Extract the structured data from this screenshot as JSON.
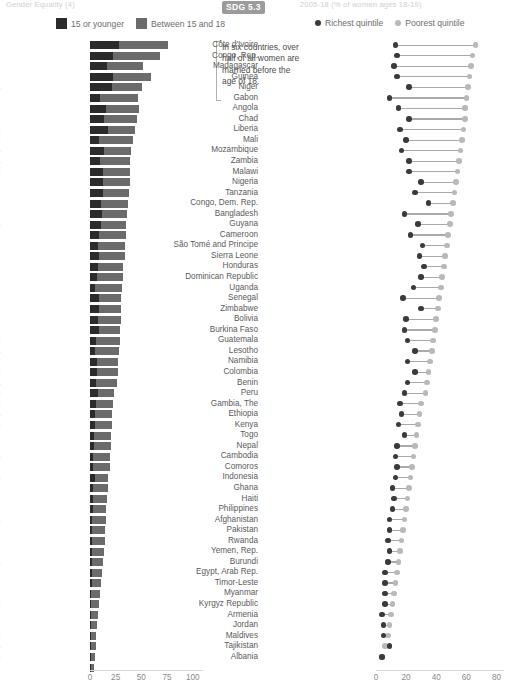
{
  "header": {
    "left_text": "Gender Equality (4)",
    "right_text": "2005-18 (% of women ages 18-19)",
    "sdg_badge": "SDG 5.3"
  },
  "legend_left": {
    "items": [
      {
        "label": "15 or younger",
        "color": "#2b2b2b",
        "icon": "square-swatch"
      },
      {
        "label": "Between 15 and 18",
        "color": "#6b6b6b",
        "icon": "square-swatch"
      }
    ]
  },
  "legend_right": {
    "items": [
      {
        "label": "Richest quintile",
        "color": "#3a3a3a",
        "icon": "dot-marker"
      },
      {
        "label": "Poorest quintile",
        "color": "#b9b9b9",
        "icon": "dot-marker"
      }
    ]
  },
  "annotation": {
    "text": "In six countries, over half of all women are married before the age of 18."
  },
  "chart_data": [
    {
      "id": "left",
      "type": "bar",
      "orientation": "horizontal",
      "stacked": true,
      "title": "",
      "xlabel": "",
      "ylabel": "",
      "xlim": [
        0,
        110
      ],
      "xticks": [
        0,
        25,
        50,
        75,
        100
      ],
      "grid": false,
      "legend_position": "top-left",
      "series": [
        {
          "name": "15 or younger",
          "color": "#2b2b2b"
        },
        {
          "name": "Between 15 and 18",
          "color": "#6b6b6b"
        }
      ],
      "categories": [
        "Niger",
        "Chad",
        "Mali",
        "Bangladesh",
        "Guinea",
        "Burkina Faso",
        "Mozambique",
        "Madagascar",
        "Nigeria",
        "Malawi",
        "Ethiopia",
        "Uganda",
        "Nepal",
        "Sierra Leone",
        "Cameroon",
        "Congo, Dem. Rep.",
        "Dominican Republic",
        "Liberia",
        "Afghanistan",
        "São Tomé and Principe",
        "Honduras",
        "Côte d'Ivoire",
        "Congo, Rep.",
        "Zimbabwe",
        "Yemen, Rep.",
        "Benin",
        "Comoros",
        "Senegal",
        "Zambia",
        "Tanzania",
        "Gambia, The",
        "Angola",
        "Guatemala",
        "India",
        "Colombia",
        "Guyana",
        "Kenya",
        "Gabon",
        "Togo",
        "Bolivia",
        "Pakistan",
        "Ghana",
        "Burundi",
        "Peru",
        "Timor-Leste",
        "Cambodia",
        "Haiti",
        "Egypt, Arab Rep.",
        "Lesotho",
        "Indonesia",
        "Myanmar",
        "Philippines",
        "Tajikistan",
        "Albania",
        "Jordan",
        "Kyrgyz Republic",
        "Namibia",
        "Rwanda",
        "Armenia",
        "Maldives"
      ],
      "values_15_or_younger": [
        28,
        22,
        17,
        22,
        21,
        10,
        16,
        14,
        18,
        9,
        14,
        10,
        13,
        13,
        13,
        11,
        12,
        11,
        9,
        8,
        9,
        8,
        7,
        5,
        9,
        9,
        8,
        9,
        6,
        5,
        7,
        7,
        6,
        8,
        6,
        5,
        5,
        4,
        4,
        3,
        3,
        5,
        3,
        3,
        3,
        2,
        2,
        2,
        2,
        2,
        2,
        2,
        1,
        1,
        1,
        1,
        1,
        1,
        1,
        1
      ],
      "values_between_15_and_18": [
        48,
        46,
        35,
        37,
        30,
        37,
        32,
        32,
        26,
        33,
        26,
        29,
        26,
        26,
        25,
        26,
        24,
        24,
        26,
        26,
        25,
        24,
        25,
        26,
        21,
        21,
        22,
        20,
        23,
        23,
        20,
        20,
        20,
        15,
        16,
        16,
        16,
        16,
        16,
        16,
        16,
        13,
        15,
        14,
        13,
        14,
        13,
        13,
        12,
        11,
        10,
        9,
        9,
        8,
        7,
        6,
        5,
        5,
        4,
        3
      ],
      "totals": [
        76,
        68,
        52,
        59,
        51,
        47,
        48,
        46,
        44,
        42,
        40,
        39,
        39,
        39,
        38,
        37,
        36,
        35,
        35,
        34,
        34,
        32,
        32,
        31,
        30,
        30,
        30,
        29,
        29,
        28,
        27,
        27,
        26,
        23,
        22,
        21,
        21,
        20,
        20,
        19,
        19,
        18,
        18,
        17,
        16,
        16,
        15,
        15,
        14,
        13,
        12,
        11,
        10,
        9,
        8,
        7,
        6,
        6,
        5,
        4
      ]
    },
    {
      "id": "right",
      "type": "dumbbell",
      "orientation": "horizontal",
      "title": "",
      "xlabel": "",
      "ylabel": "",
      "xlim": [
        0,
        85
      ],
      "xticks": [
        0,
        20,
        40,
        60,
        80
      ],
      "grid": false,
      "legend_position": "top-right",
      "series": [
        {
          "name": "Richest quintile",
          "color": "#3a3a3a"
        },
        {
          "name": "Poorest quintile",
          "color": "#b9b9b9"
        }
      ],
      "categories": [
        "Côte d'Ivoire",
        "Congo, Rep.",
        "Madagascar",
        "Guinea",
        "Niger",
        "Gabon",
        "Angola",
        "Chad",
        "Liberia",
        "Mali",
        "Mozambique",
        "Zambia",
        "Malawi",
        "Nigeria",
        "Tanzania",
        "Congo, Dem. Rep.",
        "Bangladesh",
        "Guyana",
        "Cameroon",
        "São Tomé and Principe",
        "Sierra Leone",
        "Honduras",
        "Dominican Republic",
        "Uganda",
        "Senegal",
        "Zimbabwe",
        "Bolivia",
        "Burkina Faso",
        "Guatemala",
        "Lesotho",
        "Namibia",
        "Colombia",
        "Benin",
        "Peru",
        "Gambia, The",
        "Ethiopia",
        "Kenya",
        "Togo",
        "Nepal",
        "Cambodia",
        "Comoros",
        "Indonesia",
        "Ghana",
        "Haiti",
        "Philippines",
        "Afghanistan",
        "Pakistan",
        "Rwanda",
        "Yemen, Rep.",
        "Burundi",
        "Egypt, Arab Rep.",
        "Timor-Leste",
        "Myanmar",
        "Kyrgyz Republic",
        "Armenia",
        "Jordan",
        "Maldives",
        "Tajikistan",
        "Albania"
      ],
      "richest_quintile": [
        13,
        14,
        12,
        14,
        22,
        9,
        15,
        22,
        16,
        20,
        17,
        22,
        22,
        30,
        26,
        35,
        19,
        28,
        23,
        31,
        29,
        32,
        30,
        25,
        18,
        30,
        20,
        19,
        21,
        26,
        21,
        26,
        21,
        19,
        16,
        17,
        15,
        19,
        14,
        13,
        14,
        13,
        11,
        12,
        11,
        9,
        9,
        8,
        9,
        8,
        6,
        6,
        6,
        6,
        4,
        5,
        5,
        9,
        4
      ],
      "poorest_quintile": [
        66,
        64,
        63,
        62,
        61,
        60,
        59,
        59,
        58,
        57,
        56,
        55,
        54,
        53,
        52,
        51,
        50,
        49,
        48,
        47,
        46,
        45,
        44,
        43,
        42,
        41,
        40,
        39,
        38,
        37,
        36,
        35,
        34,
        33,
        30,
        29,
        28,
        27,
        26,
        25,
        24,
        23,
        22,
        21,
        20,
        19,
        18,
        17,
        16,
        15,
        14,
        13,
        12,
        11,
        10,
        9,
        8,
        6,
        4
      ]
    }
  ],
  "axis_left": {
    "ticks": [
      "0",
      "25",
      "50",
      "75",
      "100"
    ]
  },
  "axis_right": {
    "ticks": [
      "0",
      "20",
      "40",
      "60",
      "80"
    ]
  }
}
